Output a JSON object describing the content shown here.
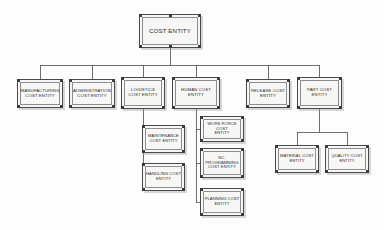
{
  "diagram": {
    "type": "organization-chart",
    "orientation": "top-down",
    "background_color": "#fdfdfd",
    "node_fill_color": "#f7f7f5",
    "node_border_color": "#4a4a4a",
    "edge_color": "#4a4a4a",
    "text_color": "#2b2b2b"
  },
  "nodes": {
    "root": {
      "id": "cost-entity",
      "label": "COST ENTITY",
      "level": 1,
      "x": 139,
      "y": 14,
      "w": 62,
      "h": 34
    },
    "level2": [
      {
        "id": "manufacturing-cost-entity",
        "label": "MANUFACTURING\nCOST ENTITY",
        "level": 2,
        "x": 17,
        "y": 79,
        "w": 46,
        "h": 29
      },
      {
        "id": "administration-cost-entity",
        "label": "ADMINISTRATION\nCOST ENTITY",
        "level": 2,
        "x": 69,
        "y": 79,
        "w": 46,
        "h": 29
      },
      {
        "id": "logistics-cost-entity",
        "label": "LOGISTICS\nCOST ENTITY",
        "level": 2,
        "x": 121,
        "y": 77,
        "w": 44,
        "h": 32
      },
      {
        "id": "human-cost-entity",
        "label": "HUMAN COST\nENTITY",
        "level": 2,
        "x": 172,
        "y": 77,
        "w": 48,
        "h": 32
      },
      {
        "id": "release-cost-entity",
        "label": "RELEASE COST\nENTITY",
        "level": 2,
        "x": 246,
        "y": 79,
        "w": 44,
        "h": 29
      },
      {
        "id": "part-cost-entity",
        "label": "PART COST\nENTITY",
        "level": 2,
        "x": 297,
        "y": 77,
        "w": 45,
        "h": 32
      }
    ],
    "level3": [
      {
        "id": "maintenance-cost-entity",
        "label": "MAINTENANCE\nCOST ENTITY",
        "level": 3,
        "parent": "logistics-cost-entity",
        "x": 142,
        "y": 125,
        "w": 43,
        "h": 28
      },
      {
        "id": "handling-cost-entity",
        "label": "HANDLING COST\nENTITY",
        "level": 3,
        "parent": "logistics-cost-entity",
        "x": 142,
        "y": 163,
        "w": 43,
        "h": 28
      },
      {
        "id": "work-force-cost-entity",
        "label": "WORK FORCE COST\nENTITY",
        "level": 3,
        "parent": "human-cost-entity",
        "x": 200,
        "y": 116,
        "w": 44,
        "h": 26
      },
      {
        "id": "nc-programming-cost-entity",
        "label": "NC-\nPROGRAMMING\nCOST ENTITY",
        "level": 3,
        "parent": "human-cost-entity",
        "x": 200,
        "y": 148,
        "w": 44,
        "h": 30
      },
      {
        "id": "planning-cost-entity",
        "label": "PLANNING COST\nENTITY",
        "level": 3,
        "parent": "human-cost-entity",
        "x": 200,
        "y": 188,
        "w": 44,
        "h": 28
      },
      {
        "id": "material-cost-entity",
        "label": "MATERIAL COST\nENTITY",
        "level": 3,
        "parent": "part-cost-entity",
        "x": 275,
        "y": 145,
        "w": 44,
        "h": 28
      },
      {
        "id": "quality-cost-entity",
        "label": "QUALITY COST\nENTITY",
        "level": 3,
        "parent": "part-cost-entity",
        "x": 325,
        "y": 145,
        "w": 44,
        "h": 28
      }
    ]
  },
  "edges": [
    {
      "from": "cost-entity",
      "to": "manufacturing-cost-entity"
    },
    {
      "from": "cost-entity",
      "to": "administration-cost-entity"
    },
    {
      "from": "cost-entity",
      "to": "logistics-cost-entity"
    },
    {
      "from": "cost-entity",
      "to": "human-cost-entity"
    },
    {
      "from": "cost-entity",
      "to": "release-cost-entity"
    },
    {
      "from": "cost-entity",
      "to": "part-cost-entity"
    },
    {
      "from": "logistics-cost-entity",
      "to": "maintenance-cost-entity"
    },
    {
      "from": "logistics-cost-entity",
      "to": "handling-cost-entity"
    },
    {
      "from": "human-cost-entity",
      "to": "work-force-cost-entity"
    },
    {
      "from": "human-cost-entity",
      "to": "nc-programming-cost-entity"
    },
    {
      "from": "human-cost-entity",
      "to": "planning-cost-entity"
    },
    {
      "from": "part-cost-entity",
      "to": "material-cost-entity"
    },
    {
      "from": "part-cost-entity",
      "to": "quality-cost-entity"
    }
  ]
}
